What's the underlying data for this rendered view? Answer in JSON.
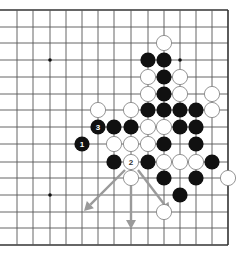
{
  "board": {
    "columns_x": [
      17,
      33,
      50,
      66,
      82,
      98,
      114,
      131,
      148,
      164,
      180,
      196,
      212,
      228
    ],
    "rows_y": [
      10,
      27,
      43,
      60,
      77,
      94,
      110,
      127,
      144,
      162,
      178,
      195,
      212,
      228,
      245
    ],
    "left_edge_x": 0,
    "right_edge_col": 13,
    "top_edge_row": 0,
    "line_color": "#555555",
    "edge_color": "#333333",
    "stone_radius": 7.6,
    "star_points": [
      [
        2,
        3
      ],
      [
        10,
        3
      ],
      [
        2,
        11
      ]
    ]
  },
  "stones": [
    {
      "col": 9,
      "row": 2,
      "color": "white"
    },
    {
      "col": 8,
      "row": 3,
      "color": "black"
    },
    {
      "col": 9,
      "row": 3,
      "color": "black"
    },
    {
      "col": 8,
      "row": 4,
      "color": "white"
    },
    {
      "col": 9,
      "row": 4,
      "color": "black"
    },
    {
      "col": 10,
      "row": 4,
      "color": "white"
    },
    {
      "col": 8,
      "row": 5,
      "color": "white"
    },
    {
      "col": 9,
      "row": 5,
      "color": "black"
    },
    {
      "col": 10,
      "row": 5,
      "color": "white"
    },
    {
      "col": 12,
      "row": 5,
      "color": "white"
    },
    {
      "col": 5,
      "row": 6,
      "color": "white"
    },
    {
      "col": 7,
      "row": 6,
      "color": "white"
    },
    {
      "col": 8,
      "row": 6,
      "color": "black"
    },
    {
      "col": 9,
      "row": 6,
      "color": "black"
    },
    {
      "col": 10,
      "row": 6,
      "color": "black"
    },
    {
      "col": 11,
      "row": 6,
      "color": "black"
    },
    {
      "col": 12,
      "row": 6,
      "color": "white"
    },
    {
      "col": 5,
      "row": 7,
      "color": "black",
      "label": "3"
    },
    {
      "col": 6,
      "row": 7,
      "color": "black"
    },
    {
      "col": 7,
      "row": 7,
      "color": "black"
    },
    {
      "col": 8,
      "row": 7,
      "color": "white"
    },
    {
      "col": 9,
      "row": 7,
      "color": "white"
    },
    {
      "col": 10,
      "row": 7,
      "color": "black"
    },
    {
      "col": 11,
      "row": 7,
      "color": "black"
    },
    {
      "col": 4,
      "row": 8,
      "color": "black",
      "label": "1"
    },
    {
      "col": 6,
      "row": 8,
      "color": "white"
    },
    {
      "col": 7,
      "row": 8,
      "color": "white"
    },
    {
      "col": 8,
      "row": 8,
      "color": "white"
    },
    {
      "col": 9,
      "row": 8,
      "color": "black"
    },
    {
      "col": 11,
      "row": 8,
      "color": "black"
    },
    {
      "col": 6,
      "row": 9,
      "color": "black"
    },
    {
      "col": 7,
      "row": 9,
      "color": "white",
      "label": "2"
    },
    {
      "col": 8,
      "row": 9,
      "color": "black"
    },
    {
      "col": 9,
      "row": 9,
      "color": "white"
    },
    {
      "col": 10,
      "row": 9,
      "color": "white"
    },
    {
      "col": 11,
      "row": 9,
      "color": "white"
    },
    {
      "col": 12,
      "row": 9,
      "color": "black"
    },
    {
      "col": 7,
      "row": 10,
      "color": "white"
    },
    {
      "col": 9,
      "row": 10,
      "color": "black"
    },
    {
      "col": 11,
      "row": 10,
      "color": "black"
    },
    {
      "col": 13,
      "row": 10,
      "color": "white"
    },
    {
      "col": 10,
      "row": 11,
      "color": "black"
    },
    {
      "col": 9,
      "row": 12,
      "color": "white"
    }
  ],
  "arrows": [
    {
      "name": "arrow-down-left",
      "x1": 125,
      "y1": 170,
      "x2": 84,
      "y2": 211
    },
    {
      "name": "arrow-down",
      "x1": 131,
      "y1": 186,
      "x2": 131,
      "y2": 229
    },
    {
      "name": "arrow-down-right",
      "x1": 138,
      "y1": 170,
      "x2": 170,
      "y2": 212
    }
  ],
  "arrow_color": "#9a9a9a",
  "colors": {
    "black_stone": "#111111",
    "white_stone": "#ffffff",
    "white_stone_border": "#888888",
    "label_on_black": "#ffffff",
    "label_on_white": "#333333"
  }
}
